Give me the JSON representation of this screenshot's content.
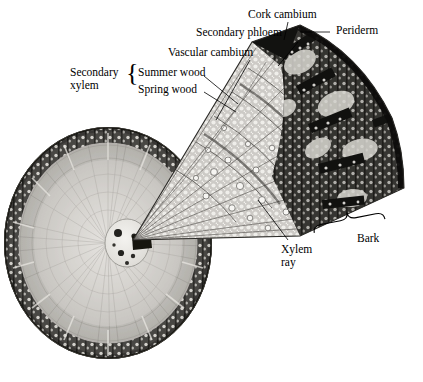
{
  "figure": {
    "kind": "botanical-micrograph-diagram",
    "background_color": "#ffffff",
    "ink_color": "#000000"
  },
  "labels": {
    "cork_cambium": "Cork cambium",
    "periderm": "Periderm",
    "secondary_phloem": "Secondary phloem",
    "vascular_cambium": "Vascular cambium",
    "secondary_xylem_line1": "Secondary",
    "secondary_xylem_line2": "xylem",
    "summer_wood": "Summer wood",
    "spring_wood": "Spring wood",
    "xylem_ray_line1": "Xylem",
    "xylem_ray_line2": "ray",
    "bark": "Bark"
  },
  "braces": {
    "xylem_group": "{",
    "bark_group": "}"
  },
  "structures": {
    "stem_cross_section": "stem-cross-section",
    "pith": "pith",
    "bark_ring": "bark-ring",
    "wedge": "enlarged-wedge",
    "wedge_bark_zone": "wedge-bark-zone",
    "wedge_xylem_zone": "wedge-xylem-zone",
    "periderm_apex": "periderm-dark-apex"
  },
  "colors": {
    "gray_light": "#c8c6c2",
    "gray_mid": "#9a9893",
    "gray_dark": "#4a4845",
    "near_black": "#1d1c1a",
    "cream": "#e4e2dd"
  }
}
